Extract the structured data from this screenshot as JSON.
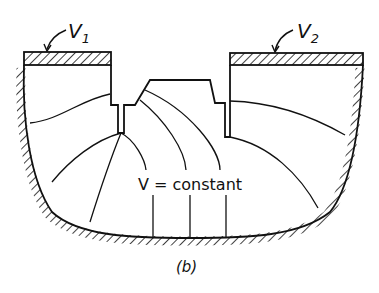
{
  "figure": {
    "caption": "(b)",
    "annotation": "V = constant",
    "electrodes": [
      {
        "id": "electrode-1",
        "label_main": "V",
        "label_sub": "1"
      },
      {
        "id": "electrode-2",
        "label_main": "V",
        "label_sub": "2"
      }
    ],
    "colors": {
      "ink": "#111111",
      "background": "#ffffff"
    }
  }
}
